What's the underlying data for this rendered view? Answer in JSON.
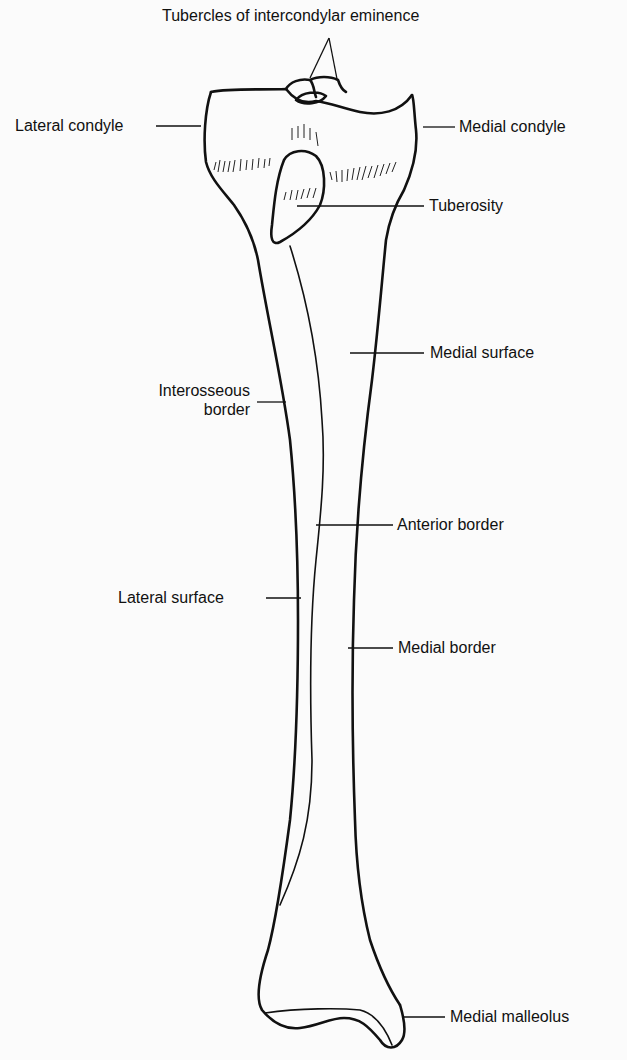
{
  "figure": {
    "labels": {
      "tubercles": "Tubercles of intercondylar eminence",
      "lateral_condyle": "Lateral condyle",
      "medial_condyle": "Medial condyle",
      "tuberosity": "Tuberosity",
      "medial_surface": "Medial surface",
      "interosseous_line1": "Interosseous",
      "interosseous_line2": "border",
      "anterior_border": "Anterior border",
      "lateral_surface": "Lateral surface",
      "medial_border": "Medial border",
      "medial_malleolus": "Medial malleolus"
    },
    "colors": {
      "background": "#fbfbfb",
      "ink": "#111111"
    }
  }
}
